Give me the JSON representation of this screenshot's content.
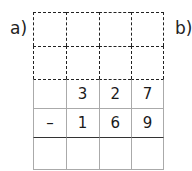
{
  "labels": {
    "a": "a)",
    "b": "b)"
  },
  "grid": {
    "columns": 4,
    "scratch_rows": [
      [
        "",
        "",
        "",
        ""
      ],
      [
        "",
        "",
        "",
        ""
      ]
    ],
    "minuend": [
      "",
      "3",
      "2",
      "7"
    ],
    "subtrahend": [
      "–",
      "1",
      "6",
      "9"
    ],
    "result": [
      "",
      "",
      "",
      ""
    ]
  }
}
